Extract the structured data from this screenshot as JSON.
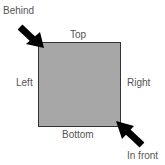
{
  "labels": {
    "behind": "Behind",
    "top": "Top",
    "left": "Left",
    "right": "Right",
    "bottom": "Bottom",
    "in_front": "In front"
  },
  "colors": {
    "square": "#a7a7a7",
    "arrow": "#000000",
    "text": "#555555"
  }
}
